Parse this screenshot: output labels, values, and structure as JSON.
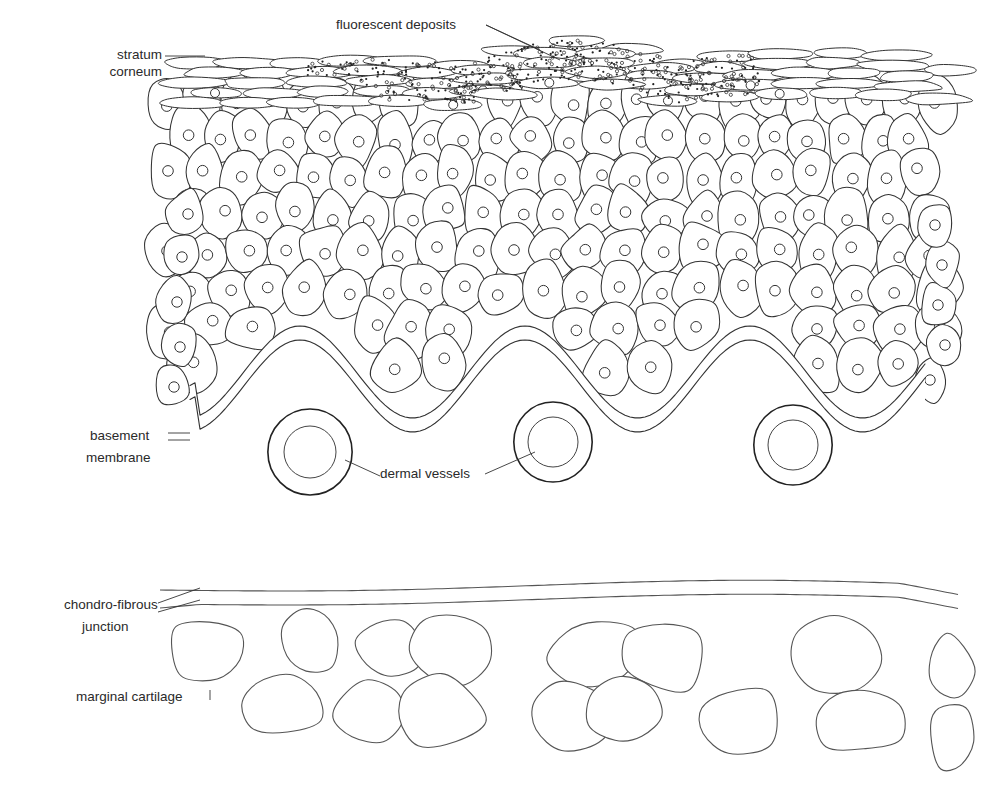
{
  "figure": {
    "labels": {
      "fluorescent_deposits": "fluorescent deposits",
      "stratum_corneum_line1": "stratum",
      "stratum_corneum_line2": "corneum",
      "basement_membrane_line1": "basement",
      "basement_membrane_line2": "membrane",
      "dermal_vessels": "dermal vessels",
      "chondro_fibrous_line1": "chondro-fibrous",
      "chondro_fibrous_line2": "junction",
      "marginal_cartilage": "marginal cartilage"
    },
    "structures": {
      "epidermis": {
        "cell_rows": 9,
        "cell_x_range": [
          160,
          955
        ],
        "cell_y_range": [
          100,
          420
        ]
      },
      "basement_membrane": {
        "peaks_x": [
          300,
          530,
          740
        ],
        "troughs_x": [
          195,
          425,
          640,
          905
        ]
      },
      "dermal_vessels": [
        {
          "cx": 310,
          "cy": 452,
          "r_outer": 43,
          "r_inner": 26
        },
        {
          "cx": 553,
          "cy": 442,
          "r_outer": 40,
          "r_inner": 25
        },
        {
          "cx": 793,
          "cy": 445,
          "r_outer": 40,
          "r_inner": 25
        }
      ],
      "cartilage_lacunae_count": 17,
      "colors": {
        "line": "#333333",
        "background": "#ffffff"
      }
    }
  }
}
